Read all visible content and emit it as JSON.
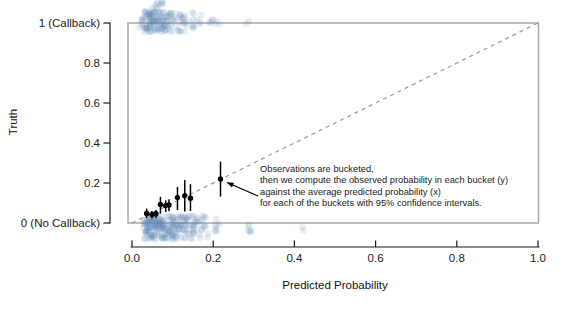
{
  "figure": {
    "x_axis_title": "Predicted Probability",
    "y_axis_title": "Truth"
  },
  "annotation": {
    "text": "Observations are bucketed,\nthen we compute the observed probability in each bucket (y)\nagainst the average predicted probability (x)\nfor each of the buckets with 95% confidence intervals."
  },
  "colors": {
    "background": "#ffffff",
    "panel_border": "#a9a9a9",
    "reference_line": "#999999",
    "axis": "#1a1a1a",
    "raw_points": "#5b87b2",
    "bucket_points": "#000000"
  },
  "chart_data": {
    "type": "scatter",
    "title": "",
    "xlabel": "Predicted Probability",
    "ylabel": "Truth",
    "xlim": [
      0,
      1
    ],
    "ylim": [
      0,
      1
    ],
    "grid": false,
    "x_ticks": [
      {
        "value": 0.0,
        "label": "0.0"
      },
      {
        "value": 0.2,
        "label": "0.2"
      },
      {
        "value": 0.4,
        "label": "0.4"
      },
      {
        "value": 0.6,
        "label": "0.6"
      },
      {
        "value": 0.8,
        "label": "0.8"
      },
      {
        "value": 1.0,
        "label": "1.0"
      }
    ],
    "y_ticks": [
      {
        "value": 0.0,
        "label": "0 (No Callback)"
      },
      {
        "value": 0.2,
        "label": "0.2"
      },
      {
        "value": 0.4,
        "label": "0.4"
      },
      {
        "value": 0.6,
        "label": "0.6"
      },
      {
        "value": 0.8,
        "label": "0.8"
      },
      {
        "value": 1.0,
        "label": "1 (Callback)"
      }
    ],
    "reference_line": {
      "from": [
        0,
        0
      ],
      "to": [
        1,
        1
      ],
      "style": "dashed",
      "color": "#999999"
    },
    "bucketed_points": {
      "description": "observed probability per bucket vs average predicted probability, with 95% confidence intervals",
      "color": "#000000",
      "points": [
        {
          "x": 0.036,
          "y": 0.048,
          "ci_low": 0.025,
          "ci_high": 0.072
        },
        {
          "x": 0.049,
          "y": 0.042,
          "ci_low": 0.022,
          "ci_high": 0.06
        },
        {
          "x": 0.059,
          "y": 0.046,
          "ci_low": 0.026,
          "ci_high": 0.065
        },
        {
          "x": 0.07,
          "y": 0.093,
          "ci_low": 0.047,
          "ci_high": 0.131
        },
        {
          "x": 0.083,
          "y": 0.087,
          "ci_low": 0.055,
          "ci_high": 0.113
        },
        {
          "x": 0.091,
          "y": 0.09,
          "ci_low": 0.059,
          "ci_high": 0.119
        },
        {
          "x": 0.112,
          "y": 0.127,
          "ci_low": 0.065,
          "ci_high": 0.18
        },
        {
          "x": 0.13,
          "y": 0.137,
          "ci_low": 0.057,
          "ci_high": 0.215
        },
        {
          "x": 0.144,
          "y": 0.124,
          "ci_low": 0.06,
          "ci_high": 0.194
        },
        {
          "x": 0.218,
          "y": 0.22,
          "ci_low": 0.132,
          "ci_high": 0.307
        }
      ]
    },
    "raw_observations": {
      "note": "semi-transparent jittered individual observations at truth = 0 (No Callback) and truth = 1 (Callback)",
      "color": "#5b87b2",
      "alpha": 0.15,
      "radius": 3.3,
      "seed": 42,
      "clusters": [
        {
          "level": 0,
          "y0": -0.082,
          "y1": 0.038,
          "clumps": [
            {
              "cx": 0.04,
              "sd": 0.009,
              "n": 45
            },
            {
              "cx": 0.058,
              "sd": 0.01,
              "n": 45
            },
            {
              "cx": 0.078,
              "sd": 0.01,
              "n": 40
            },
            {
              "cx": 0.097,
              "sd": 0.01,
              "n": 32
            },
            {
              "cx": 0.115,
              "sd": 0.009,
              "n": 24
            },
            {
              "cx": 0.135,
              "sd": 0.009,
              "n": 26
            },
            {
              "cx": 0.152,
              "sd": 0.008,
              "n": 16
            },
            {
              "cx": 0.168,
              "sd": 0.008,
              "n": 12
            },
            {
              "cx": 0.18,
              "sd": 0.006,
              "n": 6
            },
            {
              "cx": 0.208,
              "sd": 0.008,
              "n": 7,
              "y0": -0.05,
              "y1": 0.02
            },
            {
              "cx": 0.288,
              "sd": 0.007,
              "n": 6,
              "y0": -0.045,
              "y1": 0.02
            },
            {
              "cx": 0.42,
              "sd": 0.003,
              "n": 2,
              "y0": -0.04,
              "y1": 0.0
            }
          ]
        },
        {
          "level": 1,
          "y0": 0.952,
          "y1": 1.058,
          "clumps": [
            {
              "cx": 0.033,
              "sd": 0.009,
              "n": 30
            },
            {
              "cx": 0.05,
              "sd": 0.009,
              "n": 32
            },
            {
              "cx": 0.066,
              "sd": 0.009,
              "n": 28
            },
            {
              "cx": 0.082,
              "sd": 0.009,
              "n": 22
            },
            {
              "cx": 0.098,
              "sd": 0.009,
              "n": 16
            },
            {
              "cx": 0.115,
              "sd": 0.009,
              "n": 12
            },
            {
              "cx": 0.132,
              "sd": 0.008,
              "n": 10
            },
            {
              "cx": 0.15,
              "sd": 0.007,
              "n": 7
            },
            {
              "cx": 0.165,
              "sd": 0.006,
              "n": 4
            },
            {
              "cx": 0.196,
              "sd": 0.009,
              "n": 5,
              "y0": 0.985,
              "y1": 1.03
            },
            {
              "cx": 0.215,
              "sd": 0.004,
              "n": 2,
              "y0": 0.99,
              "y1": 1.01
            },
            {
              "cx": 0.282,
              "sd": 0.004,
              "n": 2,
              "y0": 0.995,
              "y1": 1.01
            },
            {
              "cx": 0.065,
              "sd": 0.013,
              "n": 10,
              "y0": 1.065,
              "y1": 1.11
            }
          ]
        }
      ]
    },
    "annotation": {
      "text_lines": [
        "Observations are bucketed,",
        "then we compute the observed probability in each bucket (y)",
        "against the average predicted probability (x)",
        "for each of the buckets with 95% confidence intervals."
      ],
      "arrow_points_to": {
        "x": 0.218,
        "y": 0.22
      }
    }
  }
}
